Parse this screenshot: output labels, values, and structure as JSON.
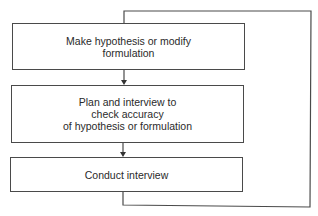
{
  "diagram": {
    "type": "flowchart-cycle",
    "boxes": [
      {
        "id": "hypothesis",
        "label": "Make hypothesis or modify\nformulation"
      },
      {
        "id": "plan",
        "label": "Plan and interview to\ncheck accuracy\nof hypothesis or formulation"
      },
      {
        "id": "conduct",
        "label": "Conduct interview"
      }
    ],
    "edges": [
      {
        "from": "hypothesis",
        "to": "plan",
        "style": "arrow"
      },
      {
        "from": "plan",
        "to": "conduct",
        "style": "arrow"
      },
      {
        "from": "conduct",
        "to": "hypothesis",
        "style": "feedback-loop-right"
      }
    ],
    "colors": {
      "line": "#4a4a4a",
      "text": "#2a2a2a",
      "background": "#ffffff"
    }
  }
}
